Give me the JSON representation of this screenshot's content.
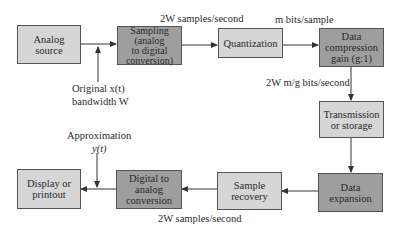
{
  "diagram": {
    "type": "block-diagram",
    "colors": {
      "light_block": "#d6d6d6",
      "dark_block": "#9e9e9e",
      "line": "#333333"
    },
    "blocks": [
      {
        "id": "analog_source",
        "label": "Analog\nsource",
        "shade": "light"
      },
      {
        "id": "sampling",
        "label": "Sampling\n(analog\nto digital\nconversion)",
        "shade": "dark"
      },
      {
        "id": "quantization",
        "label": "Quantization",
        "shade": "light"
      },
      {
        "id": "data_compression",
        "label": "Data\ncompression\ngain (g:1)",
        "shade": "dark"
      },
      {
        "id": "transmission",
        "label": "Transmission\nor storage",
        "shade": "light"
      },
      {
        "id": "data_expansion",
        "label": "Data\nexpansion",
        "shade": "dark"
      },
      {
        "id": "sample_recovery",
        "label": "Sample\nrecovery",
        "shade": "light"
      },
      {
        "id": "digital_to_analog",
        "label": "Digital to\nanalog\nconversion",
        "shade": "dark"
      },
      {
        "id": "display",
        "label": "Display or\nprintout",
        "shade": "light"
      }
    ],
    "annotations": {
      "rate_top": "2W samples/second",
      "bits_per_sample": "m bits/sample",
      "compressed_rate": "2W m/g bits/second",
      "original_line1": "Original x(t)",
      "original_line2": "bandwidth W",
      "approx_line1": "Approximation",
      "approx_line2": "y(t)",
      "rate_bottom": "2W samples/second"
    },
    "edges": [
      [
        "analog_source",
        "sampling"
      ],
      [
        "sampling",
        "quantization"
      ],
      [
        "quantization",
        "data_compression"
      ],
      [
        "data_compression",
        "transmission"
      ],
      [
        "transmission",
        "data_expansion"
      ],
      [
        "data_expansion",
        "sample_recovery"
      ],
      [
        "sample_recovery",
        "digital_to_analog"
      ],
      [
        "digital_to_analog",
        "display"
      ]
    ]
  }
}
